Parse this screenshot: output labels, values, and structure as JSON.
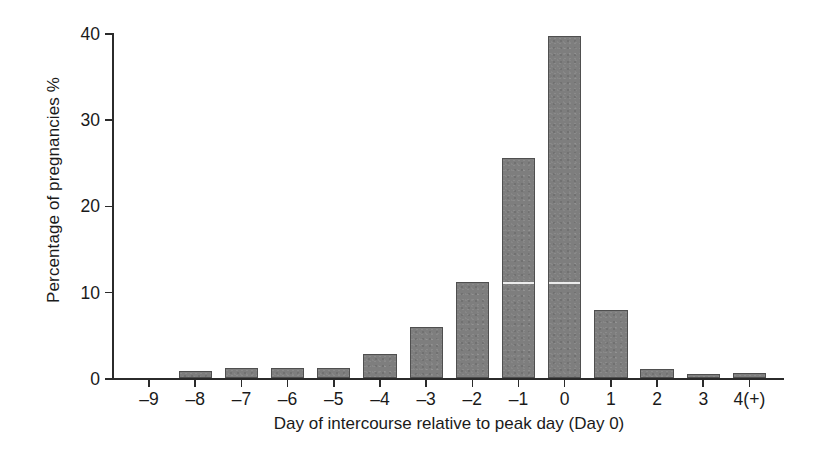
{
  "chart_data": {
    "type": "bar",
    "title": "",
    "subtitle": "",
    "xlabel": "Day of intercourse relative to peak day (Day 0)",
    "ylabel": "Percentage of pregnancies %",
    "categories": [
      "–9",
      "–8",
      "–7",
      "–6",
      "–5",
      "–4",
      "–3",
      "–2",
      "–1",
      "0",
      "1",
      "2",
      "3",
      "4(+)"
    ],
    "values": [
      0,
      0.8,
      1.2,
      1.2,
      1.2,
      2.8,
      5.9,
      11.1,
      25.5,
      39.6,
      7.9,
      1.0,
      0.5,
      0.6
    ],
    "ylim": [
      0,
      40
    ],
    "yticks": [
      0,
      10,
      20,
      30,
      40
    ],
    "ytick_labels": [
      "0",
      "10",
      "20",
      "30",
      "40"
    ],
    "grid": false,
    "legend": false,
    "legend_position": "none",
    "bar_color": "#7e7e7e",
    "bar_edge_color": "#4f4f4f",
    "axis_color": "#2b2b2b",
    "text_color": "#1a1a1a",
    "background": "#ffffff"
  }
}
